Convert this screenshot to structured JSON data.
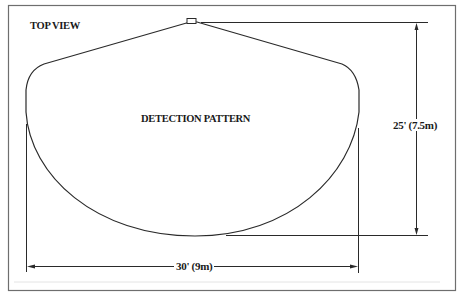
{
  "diagram": {
    "title": "TOP VIEW",
    "pattern_label": "DETECTION PATTERN",
    "depth_dimension": "25' (7.5m)",
    "width_dimension": "30' (9m)",
    "colors": {
      "line": "#2a2a2a",
      "frame": "#6e6e6e",
      "background": "#ffffff"
    }
  }
}
